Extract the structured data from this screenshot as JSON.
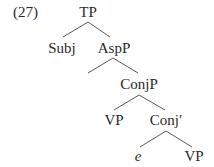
{
  "example_number": "(27)",
  "tree": {
    "root": "TP",
    "nodes": {
      "tp": {
        "label": "TP"
      },
      "subj": {
        "label": "Subj"
      },
      "aspp": {
        "label": "AspP"
      },
      "conjp": {
        "label": "ConjP"
      },
      "vp1": {
        "label": "VP"
      },
      "conj_bar": {
        "label": "Conj′"
      },
      "e": {
        "label": "e"
      },
      "vp2": {
        "label": "VP"
      }
    },
    "edges": [
      [
        "TP",
        "Subj"
      ],
      [
        "TP",
        "AspP"
      ],
      [
        "AspP",
        "(empty)"
      ],
      [
        "AspP",
        "ConjP"
      ],
      [
        "ConjP",
        "VP"
      ],
      [
        "ConjP",
        "Conj′"
      ],
      [
        "Conj′",
        "e"
      ],
      [
        "Conj′",
        "VP"
      ]
    ]
  },
  "colors": {
    "text": "#2a2a2a",
    "lines": "#5a5a5a",
    "background": "#ffffff"
  }
}
